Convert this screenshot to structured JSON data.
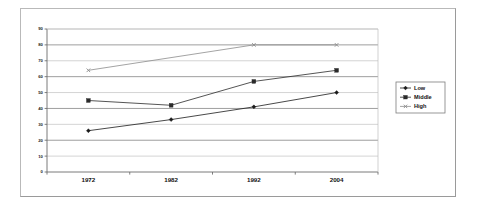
{
  "chart_data": {
    "type": "line",
    "title": "",
    "subtitle": "",
    "xlabel": "",
    "ylabel": "",
    "categories": [
      "1972",
      "1982",
      "1992",
      "2004"
    ],
    "series": [
      {
        "name": "Low",
        "marker": "diamond",
        "values": [
          26,
          33,
          41,
          50
        ]
      },
      {
        "name": "Middle",
        "marker": "square",
        "values": [
          45,
          42,
          57,
          64
        ]
      },
      {
        "name": "High",
        "marker": "cross",
        "values": [
          64,
          null,
          80,
          80
        ]
      }
    ],
    "ylim": [
      0,
      90
    ],
    "ytick_labels": [
      "90",
      "80",
      "70",
      "60",
      "50",
      "40",
      "30",
      "20",
      "10",
      "0"
    ],
    "ytick_values": [
      90,
      80,
      70,
      60,
      50,
      40,
      30,
      20,
      10,
      0
    ],
    "grid": true,
    "grid_axis": "y",
    "legend_position": "right",
    "legend_entries": [
      "Low",
      "Middle",
      "High"
    ],
    "colors": {
      "low": "#1a1a1a",
      "middle": "#2a2a2a",
      "high": "#8c8c8c",
      "axis": "#555555",
      "grid": "#a8a8a8",
      "frame": "#b9b9b9",
      "plot_border": "#8f8f8f",
      "background": "#ffffff"
    }
  }
}
